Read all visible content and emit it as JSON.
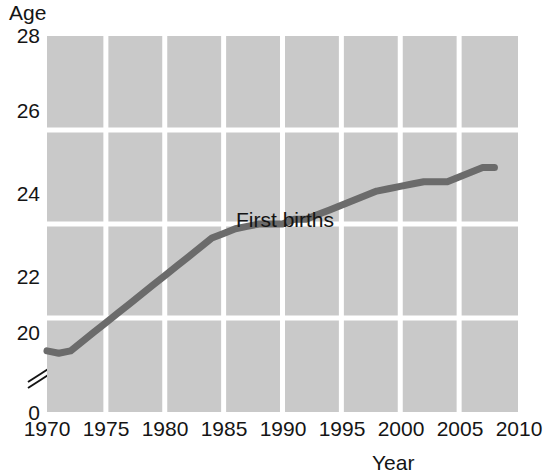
{
  "chart_data": {
    "type": "line",
    "title": "",
    "xlabel": "Year",
    "ylabel": "Age",
    "xlim": [
      1970,
      2010
    ],
    "ylim": [
      20,
      28
    ],
    "y_axis_break": true,
    "y_axis_break_note": "axis broken between 0 and 20",
    "grid": true,
    "legend_position": "inline-annotation",
    "x_ticks": [
      "1970",
      "1975",
      "1980",
      "1985",
      "1990",
      "1995",
      "2000",
      "2005",
      "2010"
    ],
    "y_ticks": [
      "0",
      "20",
      "22",
      "24",
      "26",
      "28"
    ],
    "series": [
      {
        "name": "First births",
        "color": "#6b6b6b",
        "x": [
          1970,
          1971,
          1972,
          1973,
          1974,
          1975,
          1976,
          1977,
          1978,
          1979,
          1980,
          1981,
          1982,
          1983,
          1984,
          1985,
          1986,
          1987,
          1988,
          1989,
          1990,
          1991,
          1992,
          1993,
          1994,
          1995,
          1996,
          1997,
          1998,
          1999,
          2000,
          2001,
          2002,
          2003,
          2004,
          2005,
          2006,
          2007,
          2008
        ],
        "values": [
          21.3,
          21.25,
          21.3,
          21.5,
          21.7,
          21.9,
          22.1,
          22.3,
          22.5,
          22.7,
          22.9,
          23.1,
          23.3,
          23.5,
          23.7,
          23.8,
          23.9,
          23.95,
          24.0,
          24.0,
          24.0,
          24.1,
          24.1,
          24.2,
          24.3,
          24.4,
          24.5,
          24.6,
          24.7,
          24.75,
          24.8,
          24.85,
          24.9,
          24.9,
          24.9,
          25.0,
          25.1,
          25.2,
          25.2
        ]
      }
    ],
    "annotations": [
      {
        "text": "First births",
        "x": 1988,
        "y": 23.1
      }
    ]
  },
  "axes": {
    "y_title": "Age",
    "x_title": "Year",
    "y_ticks": [
      {
        "label": "28",
        "value": 28
      },
      {
        "label": "26",
        "value": 26
      },
      {
        "label": "24",
        "value": 24
      },
      {
        "label": "22",
        "value": 22
      },
      {
        "label": "20",
        "value": 20
      },
      {
        "label": "0",
        "value": 0
      }
    ],
    "x_ticks": [
      {
        "label": "1970",
        "value": 1970
      },
      {
        "label": "1975",
        "value": 1975
      },
      {
        "label": "1980",
        "value": 1980
      },
      {
        "label": "1985",
        "value": 1985
      },
      {
        "label": "1990",
        "value": 1990
      },
      {
        "label": "1995",
        "value": 1995
      },
      {
        "label": "2000",
        "value": 2000
      },
      {
        "label": "2005",
        "value": 2005
      },
      {
        "label": "2010",
        "value": 2010
      }
    ]
  },
  "style": {
    "plot_background": "#c9c9c9",
    "gridline_color": "#ffffff",
    "series_color": "#6b6b6b",
    "text_color": "#151515",
    "page_background": "#ffffff"
  }
}
